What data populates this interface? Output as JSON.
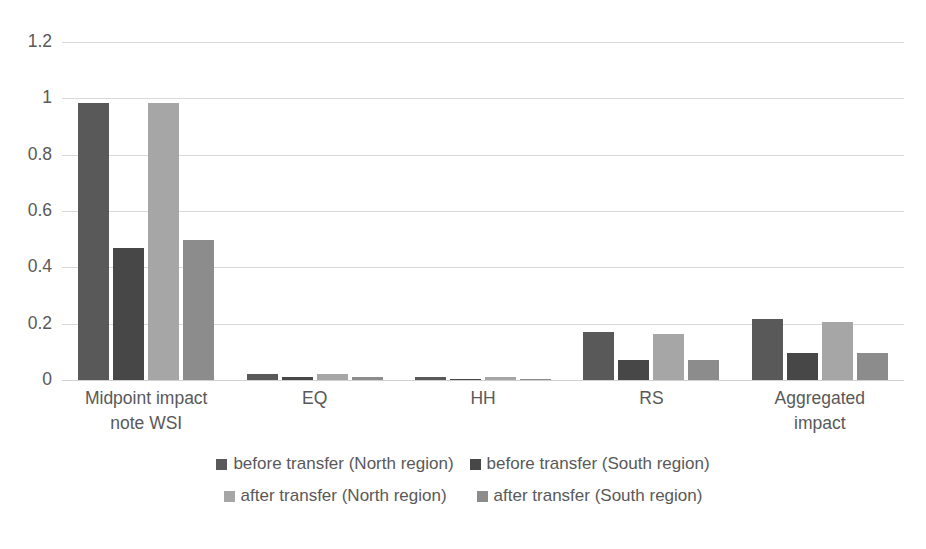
{
  "chart_data": {
    "type": "bar",
    "title": "",
    "subtitle": "",
    "xlabel": "",
    "ylabel": "",
    "ylim": [
      0,
      1.2
    ],
    "yticks": [
      "0",
      "0.2",
      "0.4",
      "0.6",
      "0.8",
      "1",
      "1.2"
    ],
    "ytick_values": [
      0,
      0.2,
      0.4,
      0.6,
      0.8,
      1,
      1.2
    ],
    "grid": true,
    "legend_position": "bottom",
    "categories": [
      "Midpoint impact note WSI",
      "EQ",
      "HH",
      "RS",
      "Aggregated impact"
    ],
    "category_lines": [
      [
        "Midpoint impact",
        "note WSI"
      ],
      [
        "EQ"
      ],
      [
        "HH"
      ],
      [
        "RS"
      ],
      [
        "Aggregated",
        "impact"
      ]
    ],
    "series": [
      {
        "name": "before transfer (North region)",
        "color": "#595959",
        "values": [
          0.985,
          0.02,
          0.012,
          0.172,
          0.215
        ]
      },
      {
        "name": "before transfer (South region)",
        "color": "#474747",
        "values": [
          0.47,
          0.012,
          0.005,
          0.072,
          0.095
        ]
      },
      {
        "name": "after transfer (North region)",
        "color": "#a6a6a6",
        "values": [
          0.985,
          0.02,
          0.012,
          0.162,
          0.205
        ]
      },
      {
        "name": "after transfer (South region)",
        "color": "#8c8c8c",
        "values": [
          0.497,
          0.012,
          0.005,
          0.072,
          0.095
        ]
      }
    ]
  },
  "style": {
    "gridline_color": "#d9d9d9",
    "text_color": "#595959",
    "background": "#ffffff"
  }
}
